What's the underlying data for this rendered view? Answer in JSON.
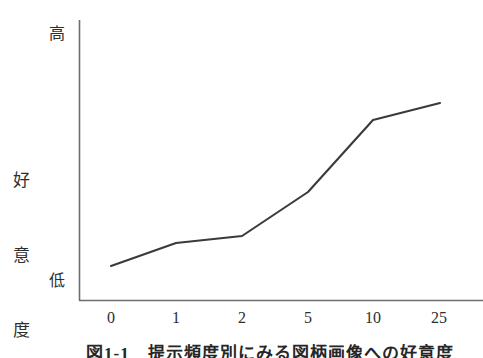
{
  "chart_data": {
    "type": "line",
    "title": "",
    "xlabel": "",
    "ylabel": "好意度",
    "x_tick_labels": [
      "0",
      "1",
      "2",
      "5",
      "10",
      "25"
    ],
    "categories": [
      "0",
      "1",
      "2",
      "5",
      "10",
      "25"
    ],
    "values": [
      12,
      24,
      28,
      51,
      90,
      99
    ],
    "y_axis_top_label": "高",
    "y_axis_bottom_label": "低",
    "ylim": [
      0,
      100
    ],
    "y_tick_labels": [],
    "grid": false,
    "legend": null,
    "series": [
      {
        "name": "好意度",
        "values": [
          12,
          24,
          28,
          51,
          90,
          99
        ]
      }
    ],
    "annotations": [],
    "line_color": "#3a3a3a",
    "axis_color": "#6e6e6e",
    "points_px": [
      {
        "x": 111,
        "y": 266
      },
      {
        "x": 176,
        "y": 243
      },
      {
        "x": 242,
        "y": 236
      },
      {
        "x": 308,
        "y": 192
      },
      {
        "x": 373,
        "y": 120
      },
      {
        "x": 440,
        "y": 103
      }
    ],
    "x_tick_positions_px": [
      111,
      176,
      242,
      308,
      373,
      439
    ]
  },
  "caption": {
    "text": "図1-1　提示頻度別にみる図柄画像への好意度"
  },
  "axes": {
    "y_axis_x_px": 79,
    "y_axis_top_px": 20,
    "x_axis_y_px": 300,
    "x_axis_right_px": 483
  }
}
